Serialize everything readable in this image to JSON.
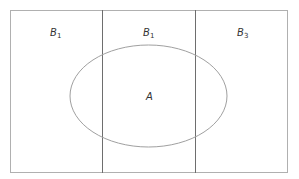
{
  "diagram": {
    "type": "venn-partition",
    "regions": [
      {
        "id": "b1-left",
        "label": "B",
        "subscript": "1"
      },
      {
        "id": "b1-middle",
        "label": "B",
        "subscript": "1"
      },
      {
        "id": "b3-right",
        "label": "B",
        "subscript": "3"
      }
    ],
    "ellipse": {
      "label": "A"
    },
    "colors": {
      "border": "#9a9a9a",
      "divider": "#6e6e6e",
      "ellipse": "#a0a0a0",
      "text": "#333333"
    }
  }
}
